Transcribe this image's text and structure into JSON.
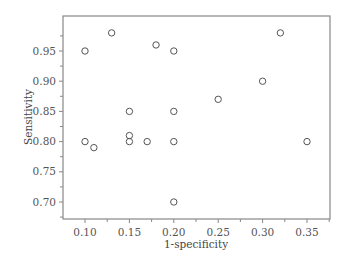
{
  "chart_data": {
    "type": "scatter",
    "title": "",
    "xlabel": "1-specificity",
    "ylabel": "Sensitivity",
    "xlim": [
      0.075,
      0.375
    ],
    "ylim": [
      0.672,
      1.0
    ],
    "xticks": [
      0.1,
      0.15,
      0.2,
      0.25,
      0.3,
      0.35
    ],
    "xtick_labels": [
      "0.10",
      "0.15",
      "0.20",
      "0.25",
      "0.30",
      "0.35"
    ],
    "yticks": [
      0.7,
      0.75,
      0.8,
      0.85,
      0.9,
      0.95
    ],
    "ytick_labels": [
      "0.70",
      "0.75",
      "0.80",
      "0.85",
      "0.90",
      "0.95"
    ],
    "grid": false,
    "legend": null,
    "marker": "open-circle",
    "points": [
      {
        "x": 0.1,
        "y": 0.95
      },
      {
        "x": 0.13,
        "y": 0.98
      },
      {
        "x": 0.18,
        "y": 0.96
      },
      {
        "x": 0.2,
        "y": 0.95
      },
      {
        "x": 0.32,
        "y": 0.98
      },
      {
        "x": 0.3,
        "y": 0.9
      },
      {
        "x": 0.25,
        "y": 0.87
      },
      {
        "x": 0.15,
        "y": 0.85
      },
      {
        "x": 0.2,
        "y": 0.85
      },
      {
        "x": 0.15,
        "y": 0.81
      },
      {
        "x": 0.1,
        "y": 0.8
      },
      {
        "x": 0.11,
        "y": 0.79
      },
      {
        "x": 0.15,
        "y": 0.8
      },
      {
        "x": 0.17,
        "y": 0.8
      },
      {
        "x": 0.2,
        "y": 0.8
      },
      {
        "x": 0.35,
        "y": 0.8
      },
      {
        "x": 0.2,
        "y": 0.7
      }
    ]
  },
  "colors": {
    "axis": "#888888",
    "marker": "#555555",
    "text": "#444444"
  }
}
